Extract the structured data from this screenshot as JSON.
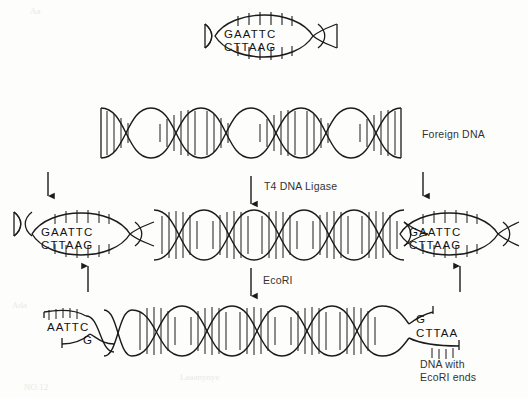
{
  "figure": {
    "background_color": "#fdfdfc",
    "ink_color": "#1b1b1b"
  },
  "labels": {
    "foreign_dna": "Foreign DNA",
    "ligase": "T4 DNA Ligase",
    "ecori_enzyme_italic": "Eco",
    "ecori_enzyme_roman": "RI",
    "ends_line1": "DNA with",
    "ends_line2_italic": "Eco",
    "ends_line2_roman": "RI ends"
  },
  "sequences": {
    "top_fragment": {
      "top_strand": "GAATTC",
      "bottom_strand": "CTTAAG"
    },
    "ligated_left_site": {
      "top_strand": "GAATTC",
      "bottom_strand": "CTTAAG"
    },
    "ligated_right_site": {
      "top_strand": "GAATTC",
      "bottom_strand": "CTTAAG"
    },
    "cut_left_end": {
      "top_strand": "AATTC",
      "bottom_strand": "G"
    },
    "cut_right_end": {
      "top_strand": "G",
      "bottom_strand": "CTTAA"
    }
  },
  "arrows": {
    "ligase_arrow": "down",
    "ecori_arrow": "down",
    "cut_marks_top": [
      "down",
      "down"
    ],
    "cut_marks_bottom": [
      "up",
      "up"
    ]
  },
  "rows": [
    {
      "name": "top-fragment-row",
      "description": "EcoRI fragment with GAATTC/CTTAAG recognition site"
    },
    {
      "name": "foreign-dna-row",
      "description": "Linear foreign DNA duplex, blunt drawn ends"
    },
    {
      "name": "ligated-row",
      "description": "Foreign DNA flanked by two EcoRI sites after ligation"
    },
    {
      "name": "cut-row",
      "description": "DNA with EcoRI sticky ends after digestion"
    }
  ],
  "watermarks": [
    "Aa",
    "Ada",
    "Aaa",
    "Laaanynye",
    "NO.12"
  ]
}
